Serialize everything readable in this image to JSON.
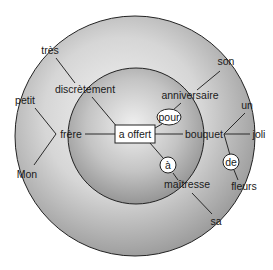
{
  "diagram": {
    "type": "dependency-tree-concentric",
    "center_node": {
      "id": "verb",
      "label": "a offert",
      "shape": "box"
    },
    "rings": {
      "outer": {
        "cx": 135,
        "cy": 136,
        "r": 120
      },
      "inner": {
        "cx": 136,
        "cy": 136,
        "r": 68
      }
    },
    "nodes": [
      {
        "id": "tres",
        "label": "très",
        "x": 40,
        "y": 53
      },
      {
        "id": "discretement",
        "label": "discrètement",
        "x": 93,
        "y": 92
      },
      {
        "id": "petit",
        "label": "petit",
        "x": 30,
        "y": 103
      },
      {
        "id": "frere",
        "label": "frère",
        "x": 72,
        "y": 138
      },
      {
        "id": "mon",
        "label": "Mon",
        "x": 32,
        "y": 176
      },
      {
        "id": "son",
        "label": "son",
        "x": 218,
        "y": 65
      },
      {
        "id": "anniversaire",
        "label": "anniversaire",
        "x": 185,
        "y": 99
      },
      {
        "id": "pour",
        "label": "pour",
        "x": 169,
        "y": 118,
        "shape": "ellipse"
      },
      {
        "id": "un",
        "label": "un",
        "x": 248,
        "y": 107
      },
      {
        "id": "bouquet",
        "label": "bouquet",
        "x": 206,
        "y": 138
      },
      {
        "id": "joli",
        "label": "joli",
        "x": 259,
        "y": 138
      },
      {
        "id": "a",
        "label": "à",
        "x": 169,
        "y": 166,
        "shape": "circle"
      },
      {
        "id": "de",
        "label": "de",
        "x": 232,
        "y": 162,
        "shape": "circle"
      },
      {
        "id": "maitresse",
        "label": "maîtresse",
        "x": 188,
        "y": 186
      },
      {
        "id": "fleurs",
        "label": "fleurs",
        "x": 247,
        "y": 187
      },
      {
        "id": "sa",
        "label": "sa",
        "x": 218,
        "y": 222
      }
    ],
    "edges": [
      [
        "verb",
        "discretement"
      ],
      [
        "discretement",
        "tres"
      ],
      [
        "verb",
        "frere"
      ],
      [
        "frere",
        "petit"
      ],
      [
        "frere",
        "mon"
      ],
      [
        "verb",
        "pour"
      ],
      [
        "pour",
        "anniversaire"
      ],
      [
        "anniversaire",
        "son"
      ],
      [
        "verb",
        "bouquet"
      ],
      [
        "bouquet",
        "un"
      ],
      [
        "bouquet",
        "joli"
      ],
      [
        "bouquet",
        "de"
      ],
      [
        "de",
        "fleurs"
      ],
      [
        "verb",
        "a"
      ],
      [
        "a",
        "maitresse"
      ],
      [
        "maitresse",
        "sa"
      ]
    ]
  },
  "labels": {
    "verb": "a offert",
    "tres": "très",
    "discretement": "discrètement",
    "petit": "petit",
    "frere": "frère",
    "mon": "Mon",
    "son": "son",
    "anniversaire": "anniversaire",
    "pour": "pour",
    "un": "un",
    "bouquet": "bouquet",
    "joli": "joli",
    "a": "à",
    "de": "de",
    "maitresse": "maîtresse",
    "fleurs": "fleurs",
    "sa": "sa"
  }
}
